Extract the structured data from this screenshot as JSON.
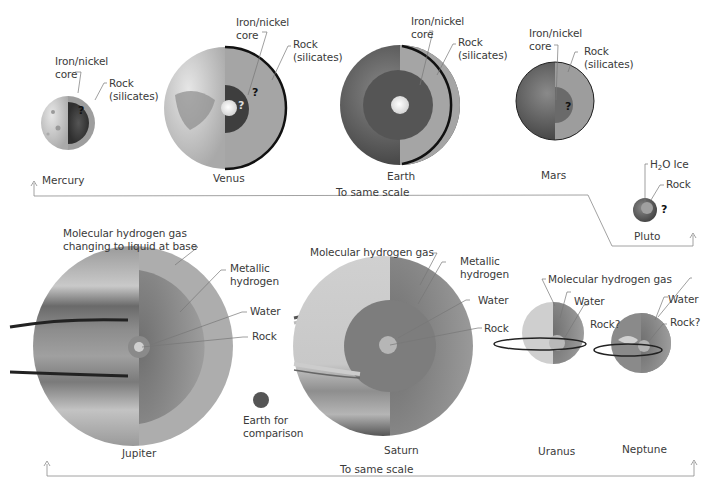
{
  "diagram": {
    "type": "planetary-interiors",
    "top_row": {
      "scale_label": "To same scale",
      "planets": [
        {
          "name": "Mercury",
          "labels": [
            "Iron/nickel core",
            "Rock (silicates)"
          ],
          "unknown_mark": "?"
        },
        {
          "name": "Venus",
          "labels": [
            "Iron/nickel core",
            "Rock (silicates)"
          ],
          "unknown_mark": "?"
        },
        {
          "name": "Earth",
          "labels": [
            "Iron/nickel core",
            "Rock (silicates)"
          ]
        },
        {
          "name": "Mars",
          "labels": [
            "Iron/nickel core",
            "Rock (silicates)"
          ],
          "unknown_mark": "?"
        },
        {
          "name": "Pluto",
          "labels": [
            "H2O Ice",
            "Rock"
          ],
          "unknown_mark": "?"
        }
      ]
    },
    "bottom_row": {
      "scale_label": "To same scale",
      "planets": [
        {
          "name": "Jupiter",
          "labels": [
            "Molecular hydrogen gas changing to liquid at base",
            "Metallic hydrogen",
            "Water",
            "Rock"
          ]
        },
        {
          "name": "Saturn",
          "labels": [
            "Molecular hydrogen gas",
            "Metallic hydrogen",
            "Water",
            "Rock"
          ]
        },
        {
          "name": "Uranus",
          "labels": [
            "Molecular hydrogen gas",
            "Water",
            "Rock?"
          ]
        },
        {
          "name": "Neptune",
          "labels": [
            "Molecular hydrogen gas",
            "Water",
            "Rock?"
          ]
        }
      ],
      "comparison": "Earth for comparison"
    }
  },
  "text": {
    "mercury": {
      "name": "Mercury",
      "core1": "Iron/nickel",
      "core2": "core",
      "rock1": "Rock",
      "rock2": "(silicates)",
      "q": "?"
    },
    "venus": {
      "name": "Venus",
      "core1": "Iron/nickel",
      "core2": "core",
      "rock1": "Rock",
      "rock2": "(silicates)",
      "q": "?"
    },
    "earth": {
      "name": "Earth",
      "core1": "Iron/nickel",
      "core2": "core",
      "rock1": "Rock",
      "rock2": "(silicates)"
    },
    "mars": {
      "name": "Mars",
      "core1": "Iron/nickel",
      "core2": "core",
      "rock1": "Rock",
      "rock2": "(silicates)",
      "q": "?"
    },
    "pluto": {
      "name": "Pluto",
      "ice_pre": "H",
      "ice_sub": "2",
      "ice_post": "O Ice",
      "rock": "Rock",
      "q": "?"
    },
    "top_scale": "To same scale",
    "jupiter": {
      "name": "Jupiter",
      "gas1": "Molecular hydrogen gas",
      "gas2": "changing to liquid at base",
      "metal1": "Metallic",
      "metal2": "hydrogen",
      "water": "Water",
      "rock": "Rock"
    },
    "saturn": {
      "name": "Saturn",
      "gas": "Molecular hydrogen gas",
      "metal1": "Metallic",
      "metal2": "hydrogen",
      "water": "Water",
      "rock": "Rock"
    },
    "uranus": {
      "name": "Uranus",
      "water": "Water",
      "rock": "Rock?"
    },
    "neptune": {
      "name": "Neptune",
      "water": "Water",
      "rock": "Rock?"
    },
    "ice_giants_gas": "Molecular hydrogen gas",
    "earth_cmp1": "Earth for",
    "earth_cmp2": "comparison",
    "bottom_scale": "To same scale"
  },
  "colors": {
    "background": "#ffffff",
    "text": "#3a3a3a",
    "leader_line": "#777777",
    "mantle": "#a8a8a8",
    "core_dark": "#4a4a4a",
    "crust_edge": "#111111"
  }
}
